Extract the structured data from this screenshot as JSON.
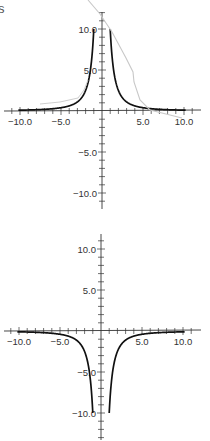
{
  "page": {
    "corner_text": "s",
    "background": "#ffffff",
    "axis_color": "#333333",
    "curve_color": "#111111",
    "artifact_color": "#c8c8c8"
  },
  "chart_data": [
    {
      "type": "line",
      "title": "",
      "function": "y = 10/x^2",
      "xlabel": "",
      "ylabel": "",
      "xlim": [
        -12,
        12
      ],
      "ylim": [
        -12,
        12
      ],
      "grid": false,
      "legend": "none",
      "x_tick_labels": [
        "-10.0",
        "-5.0",
        "5.0",
        "10.0"
      ],
      "y_tick_labels": [
        "10.0",
        "5.0",
        "-5.0",
        "-10.0"
      ],
      "minor_tick_step": 1,
      "series": [
        {
          "name": "y = 10/x²",
          "x": [
            -10,
            -8,
            -6,
            -5,
            -4,
            -3,
            -2.5,
            -2,
            -1.5,
            -1.2,
            -1,
            -0.9,
            0.9,
            1,
            1.2,
            1.5,
            2,
            2.5,
            3,
            4,
            5,
            6,
            8,
            10
          ],
          "y": [
            0.1,
            0.16,
            0.28,
            0.4,
            0.63,
            1.11,
            1.6,
            2.5,
            4.44,
            6.94,
            10,
            12.3,
            12.3,
            10,
            6.94,
            4.44,
            2.5,
            1.6,
            1.11,
            0.63,
            0.4,
            0.28,
            0.16,
            0.1
          ]
        }
      ]
    },
    {
      "type": "line",
      "title": "",
      "function": "y = -10/x^2",
      "xlabel": "",
      "ylabel": "",
      "xlim": [
        -12,
        12
      ],
      "ylim": [
        -13,
        12
      ],
      "grid": false,
      "legend": "none",
      "x_tick_labels": [
        "-10.0",
        "-5.0",
        "5.0",
        "10.0"
      ],
      "y_tick_labels": [
        "10.0",
        "5.0",
        "-5.0",
        "-10.0"
      ],
      "minor_tick_step": 1,
      "series": [
        {
          "name": "y = -10/x²",
          "x": [
            -10,
            -8,
            -6,
            -5,
            -4,
            -3,
            -2.5,
            -2,
            -1.5,
            -1.2,
            -1,
            -0.9,
            0.9,
            1,
            1.2,
            1.5,
            2,
            2.5,
            3,
            4,
            5,
            6,
            8,
            10
          ],
          "y": [
            -0.1,
            -0.16,
            -0.28,
            -0.4,
            -0.63,
            -1.11,
            -1.6,
            -2.5,
            -4.44,
            -6.94,
            -10,
            -12.3,
            -12.3,
            -10,
            -6.94,
            -4.44,
            -2.5,
            -1.6,
            -1.11,
            -0.63,
            -0.4,
            -0.28,
            -0.16,
            -0.1
          ]
        }
      ]
    }
  ]
}
